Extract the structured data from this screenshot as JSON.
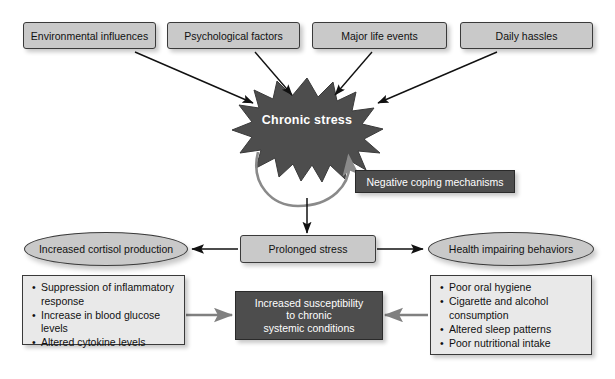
{
  "diagram": {
    "colors": {
      "box_light_fill": "#c9c9c9",
      "box_dark_fill": "#4d4d4d",
      "list_fill": "#e9e9e9",
      "burst_fill": "#4d4d4d",
      "stroke": "#3a3a3a",
      "arrow_black": "#111111",
      "arrow_gray": "#808080",
      "text_dark": "#111111",
      "text_light": "#ffffff",
      "background": "#ffffff"
    },
    "sources": [
      {
        "id": "environmental-influences",
        "label": "Environmental influences"
      },
      {
        "id": "psychological-factors",
        "label": "Psychological factors"
      },
      {
        "id": "major-life-events",
        "label": "Major life events"
      },
      {
        "id": "daily-hassles",
        "label": "Daily hassles"
      }
    ],
    "burst": {
      "label": "Chronic stress"
    },
    "coping": {
      "label": "Negative coping mechanisms"
    },
    "prolonged": {
      "label": "Prolonged stress"
    },
    "cortisol": {
      "label": "Increased cortisol production"
    },
    "behaviors": {
      "label": "Health impairing behaviors"
    },
    "cortisol_effects": {
      "items": [
        "Suppression of inflammatory response",
        "Increase in blood glucose levels",
        "Altered cytokine levels"
      ]
    },
    "behavior_effects": {
      "items": [
        "Poor oral hygiene",
        "Cigarette and alcohol consumption",
        "Altered sleep patterns",
        "Poor nutritional intake"
      ]
    },
    "outcome": {
      "line1": "Increased susceptibility",
      "line2": "to chronic",
      "line3": "systemic conditions"
    }
  }
}
